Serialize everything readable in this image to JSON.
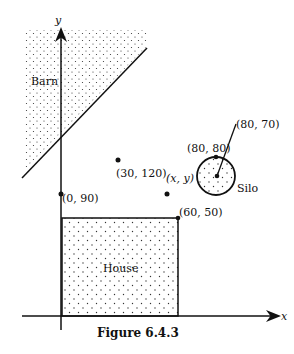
{
  "figure": {
    "caption": "Figure 6.4.3",
    "axes": {
      "x_label": "x",
      "y_label": "y"
    },
    "regions": {
      "barn": {
        "label": "Barn"
      },
      "house": {
        "label": "House",
        "corner_label": "(60, 50)"
      },
      "silo": {
        "label": "Silo",
        "top_label": "(80, 80)",
        "center_label": "(80, 70)"
      }
    },
    "points": {
      "line_intercept": "(0, 90)",
      "line_point": "(30, 120)",
      "generic_point": "(x, y)"
    }
  }
}
